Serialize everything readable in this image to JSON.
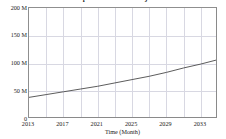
{
  "chart_data": {
    "type": "line",
    "title": "U.S. Population Growth Projection",
    "xlabel": "Time (Month)",
    "ylabel": "",
    "grid": true,
    "legend": false,
    "line_color": "#4a4a4a",
    "grid_color": "#d8d8e2",
    "frame_color": "#8a8a8a",
    "background": "#ffffff",
    "xlim": [
      2013,
      2035
    ],
    "ylim": [
      0,
      200
    ],
    "y_unit": "M",
    "x_tick_labels": [
      "2013",
      "2017",
      "2021",
      "2025",
      "2029",
      "2033"
    ],
    "x_tick_values": [
      2013,
      2017,
      2021,
      2025,
      2029,
      2033
    ],
    "x_gridline_values": [
      2015,
      2017,
      2019,
      2021,
      2023,
      2025,
      2027,
      2029,
      2031,
      2033
    ],
    "y_tick_labels": [
      "200 M",
      "150 M",
      "100 M",
      "50 M",
      "0"
    ],
    "y_tick_values": [
      200,
      150,
      100,
      50,
      0
    ],
    "y_gridline_values": [
      50,
      100,
      150
    ],
    "x": [
      2013,
      2015,
      2017,
      2019,
      2021,
      2023,
      2025,
      2027,
      2029,
      2031,
      2033,
      2035
    ],
    "values": [
      39,
      44,
      49,
      54,
      59,
      65,
      71,
      77,
      84,
      92,
      99,
      107
    ],
    "series": [
      {
        "name": "Projected value",
        "values": [
          39,
          44,
          49,
          54,
          59,
          65,
          71,
          77,
          84,
          92,
          99,
          107
        ]
      }
    ]
  }
}
